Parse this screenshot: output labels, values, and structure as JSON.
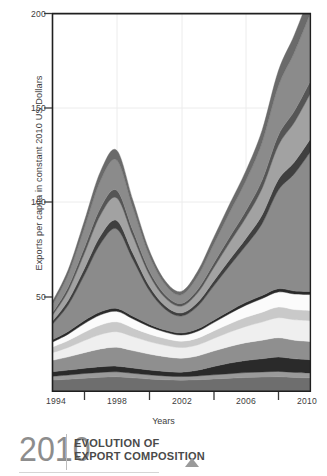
{
  "chart_data": {
    "type": "area",
    "stacked": true,
    "title": "",
    "xlabel": "Years",
    "ylabel": "Exports per capita in constant 2010 US Dollars",
    "xlim": [
      1994,
      2010
    ],
    "ylim": [
      0,
      200
    ],
    "xticks": [
      1994,
      1998,
      2002,
      2006,
      2010
    ],
    "xtick_labels": [
      "1994",
      "1998",
      "2002",
      "2006",
      "2010"
    ],
    "xminor_ticks": [
      1996,
      2000,
      2004,
      2008
    ],
    "yticks": [
      50,
      100,
      150,
      200
    ],
    "ytick_labels": [
      "50",
      "100",
      "150",
      "200"
    ],
    "grid": "faint",
    "legend": "none",
    "x": [
      1994,
      1995,
      1996,
      1997,
      1998,
      1999,
      2000,
      2001,
      2002,
      2003,
      2004,
      2005,
      2006,
      2007,
      2008,
      2009,
      2010
    ],
    "series": [
      {
        "name": "layer-1",
        "color": "#6e6e6e",
        "values": [
          6.0,
          6.5,
          7.0,
          7.5,
          7.8,
          7.2,
          6.6,
          6.2,
          6.0,
          6.2,
          6.6,
          7.0,
          7.4,
          7.6,
          7.8,
          7.4,
          7.2
        ]
      },
      {
        "name": "layer-2",
        "color": "#9a9a9a",
        "values": [
          2.0,
          2.2,
          2.5,
          2.6,
          2.6,
          2.4,
          2.2,
          2.0,
          1.9,
          2.0,
          2.2,
          2.4,
          2.6,
          2.7,
          2.8,
          2.7,
          2.6
        ]
      },
      {
        "name": "layer-3",
        "color": "#2a2a2a",
        "values": [
          2.4,
          2.6,
          2.8,
          3.0,
          3.0,
          2.8,
          2.6,
          2.4,
          2.3,
          3.0,
          4.4,
          5.6,
          6.4,
          7.0,
          7.6,
          7.2,
          7.0
        ]
      },
      {
        "name": "layer-4",
        "color": "#8f8f8f",
        "values": [
          6.0,
          7.0,
          8.2,
          9.4,
          10.0,
          9.2,
          8.4,
          7.8,
          7.4,
          7.6,
          8.2,
          8.8,
          9.4,
          9.8,
          10.2,
          9.8,
          9.6
        ]
      },
      {
        "name": "layer-5",
        "color": "#efefef",
        "values": [
          4.0,
          5.0,
          6.4,
          7.6,
          8.2,
          7.4,
          6.6,
          6.0,
          5.6,
          5.8,
          6.6,
          7.6,
          8.6,
          9.6,
          10.6,
          10.8,
          11.0
        ]
      },
      {
        "name": "layer-6",
        "color": "#c9c9c9",
        "values": [
          3.0,
          3.6,
          4.4,
          5.0,
          5.2,
          4.6,
          4.0,
          3.6,
          3.4,
          3.6,
          4.0,
          4.4,
          4.8,
          5.2,
          5.6,
          5.4,
          5.4
        ]
      },
      {
        "name": "layer-7",
        "color": "#fbfbfb",
        "values": [
          2.6,
          3.4,
          4.6,
          5.4,
          5.6,
          4.8,
          4.0,
          3.4,
          3.2,
          3.6,
          4.4,
          5.4,
          6.4,
          7.2,
          8.0,
          8.2,
          8.4
        ]
      },
      {
        "name": "layer-8",
        "color": "#2a2a2a",
        "values": [
          1.2,
          1.4,
          1.6,
          1.6,
          1.5,
          1.4,
          1.2,
          1.1,
          1.1,
          1.2,
          1.3,
          1.4,
          1.5,
          1.6,
          1.7,
          1.6,
          1.6
        ]
      },
      {
        "name": "layer-9",
        "color": "#8b8b8b",
        "values": [
          8.0,
          14.0,
          24.0,
          36.0,
          42.0,
          30.0,
          18.0,
          11.0,
          9.0,
          12.0,
          18.0,
          24.0,
          30.0,
          38.0,
          52.0,
          62.0,
          74.0
        ]
      },
      {
        "name": "layer-10",
        "color": "#3f3f3f",
        "values": [
          1.6,
          2.4,
          3.4,
          4.2,
          4.4,
          3.4,
          2.4,
          1.8,
          1.6,
          2.0,
          2.6,
          3.2,
          3.8,
          4.6,
          5.6,
          6.2,
          6.8
        ]
      },
      {
        "name": "layer-11",
        "color": "#a2a2a2",
        "values": [
          3.0,
          5.0,
          8.0,
          11.0,
          12.0,
          9.0,
          6.0,
          4.2,
          3.6,
          5.0,
          7.0,
          9.0,
          11.0,
          14.0,
          18.0,
          21.0,
          24.0
        ]
      },
      {
        "name": "layer-12",
        "color": "#555555",
        "values": [
          1.4,
          2.0,
          3.0,
          3.8,
          4.0,
          3.0,
          2.2,
          1.6,
          1.4,
          1.8,
          2.4,
          3.0,
          3.6,
          4.4,
          5.4,
          6.0,
          6.6
        ]
      },
      {
        "name": "layer-13",
        "color": "#8b8b8b",
        "values": [
          4.0,
          6.6,
          10.4,
          14.4,
          16.0,
          12.0,
          8.0,
          5.4,
          4.6,
          7.0,
          10.0,
          13.0,
          16.0,
          20.0,
          26.0,
          31.0,
          36.0
        ]
      },
      {
        "name": "layer-14",
        "color": "#6a6a6a",
        "values": [
          1.8,
          2.6,
          3.8,
          4.8,
          5.2,
          4.0,
          2.8,
          2.0,
          1.8,
          2.6,
          3.6,
          4.4,
          5.2,
          6.4,
          8.0,
          9.2,
          10.4
        ]
      }
    ]
  },
  "axis": {
    "ylabel": "Exports per capita in constant 2010 US Dollars",
    "xlabel": "Years",
    "ytick_0": "50",
    "ytick_1": "100",
    "ytick_2": "150",
    "ytick_3": "200",
    "xtick_0": "1994",
    "xtick_1": "1998",
    "xtick_2": "2002",
    "xtick_3": "2006",
    "xtick_4": "2010"
  },
  "footer": {
    "year": "2010",
    "title_line1": "EVOLUTION OF",
    "title_line2": "EXPORT COMPOSITION"
  }
}
